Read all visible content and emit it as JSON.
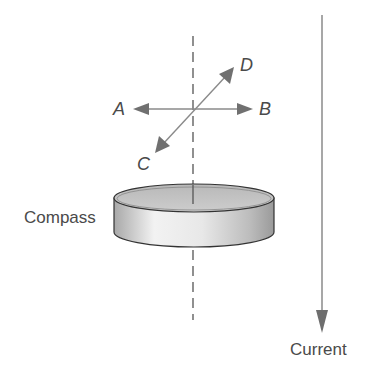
{
  "diagram": {
    "labels": {
      "a": "A",
      "b": "B",
      "c": "C",
      "d": "D",
      "compass": "Compass",
      "current": "Current"
    },
    "colors": {
      "line": "#8a8a8a",
      "arrowhead": "#6e6e6e",
      "text": "#4a4a4a",
      "compass_face": "#c4c4c4",
      "compass_side_light": "#f0f0f0",
      "compass_side_dark": "#a8a8a8"
    }
  }
}
